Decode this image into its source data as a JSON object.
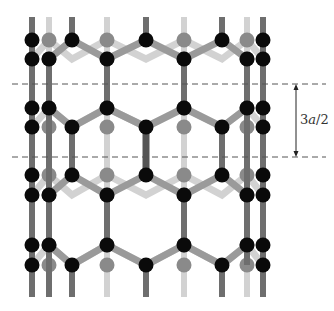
{
  "figure": {
    "annotation": {
      "label": "3a/2",
      "label_parts": [
        "3",
        "a",
        "/2"
      ],
      "arrow_x": 296,
      "y_top": 84,
      "y_bottom": 157
    },
    "dashed_lines": [
      {
        "y": 84,
        "x1": 12,
        "x2": 326
      },
      {
        "y": 157,
        "x1": 12,
        "x2": 326
      }
    ],
    "colors": {
      "front_atom": "#0a0a0a",
      "back_atom": "#8a8a8a",
      "front_bond": "#6e6e6e",
      "back_bond": "#d2d2d2",
      "mid_bond": "#9a9a9a",
      "dash": "#555555",
      "arrow": "#222222"
    }
  }
}
